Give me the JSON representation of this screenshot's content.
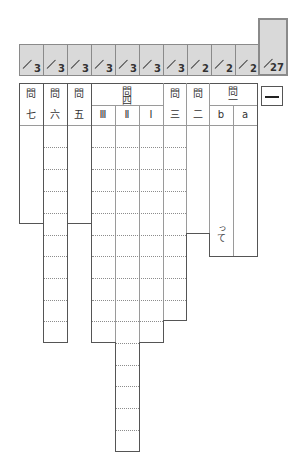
{
  "scores": {
    "cells": [
      {
        "points": "3"
      },
      {
        "points": "3"
      },
      {
        "points": "3"
      },
      {
        "points": "3"
      },
      {
        "points": "3"
      },
      {
        "points": "3"
      },
      {
        "points": "3"
      },
      {
        "points": "2"
      },
      {
        "points": "2"
      },
      {
        "points": "2"
      }
    ],
    "total": "27"
  },
  "section_number": "一",
  "headers": {
    "q7": {
      "mon": "問",
      "num": "七"
    },
    "q6": {
      "mon": "問",
      "num": "六"
    },
    "q5": {
      "mon": "問",
      "num": "五"
    },
    "q4": {
      "mon": "問",
      "num": "四",
      "sub": [
        "Ⅲ",
        "Ⅱ",
        "Ⅰ"
      ]
    },
    "q3": {
      "mon": "問",
      "num": "三"
    },
    "q2": {
      "mon": "問",
      "num": "二"
    },
    "q1": {
      "mon": "問",
      "num": "一",
      "sub": [
        "b",
        "a"
      ]
    }
  },
  "answer_suffix_b": "って"
}
